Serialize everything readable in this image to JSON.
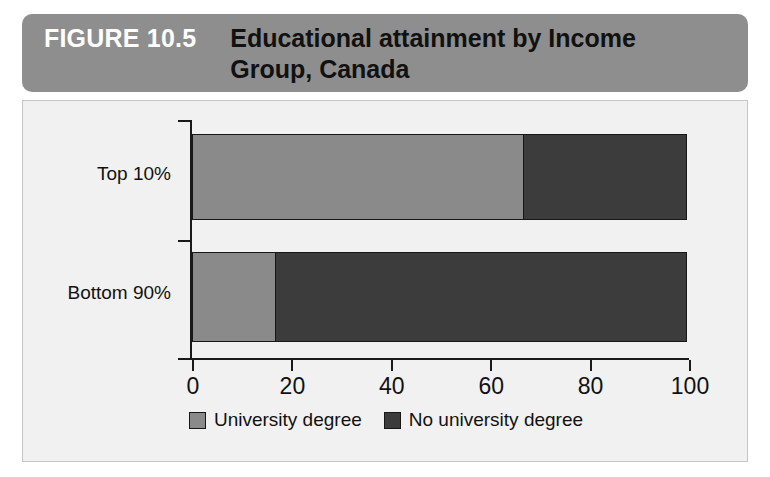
{
  "header": {
    "figure_number": "FIGURE 10.5",
    "title_line_1": "Educational attainment by Income",
    "title_line_2": "Group, Canada",
    "banner_color": "#8e8e8e",
    "figure_number_color": "#ffffff",
    "title_color": "#111111"
  },
  "panel": {
    "background_color": "#f1f1f1",
    "border_color": "#c6c6c6"
  },
  "chart_data": {
    "type": "bar",
    "orientation": "horizontal",
    "stacked": true,
    "percent": true,
    "title": "Educational attainment by Income Group, Canada",
    "xlabel": "",
    "ylabel": "",
    "categories": [
      "Top 10%",
      "Bottom 90%"
    ],
    "xlim": [
      0,
      100
    ],
    "xticks": [
      0,
      20,
      40,
      60,
      80,
      100
    ],
    "xtick_labels": [
      "0",
      "20",
      "40",
      "60",
      "80",
      "100"
    ],
    "grid": false,
    "legend_position": "bottom-center",
    "series": [
      {
        "name": "University degree",
        "color": "#8a8a8a",
        "values": [
          67,
          17
        ]
      },
      {
        "name": "No university degree",
        "color": "#3c3c3c",
        "values": [
          33,
          83
        ]
      }
    ],
    "legend": [
      "University degree",
      "No university degree"
    ]
  }
}
